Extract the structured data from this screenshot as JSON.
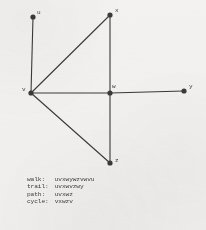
{
  "figure": {
    "type": "undirected-graph-diagram",
    "vertices": [
      {
        "id": "u",
        "label": "u",
        "x": 33,
        "y": 17,
        "label_dx": 4,
        "label_dy": -7
      },
      {
        "id": "x",
        "label": "x",
        "x": 110,
        "y": 15,
        "label_dx": 5,
        "label_dy": -7
      },
      {
        "id": "v",
        "label": "v",
        "x": 31,
        "y": 93,
        "label_dx": -9,
        "label_dy": -6
      },
      {
        "id": "w",
        "label": "w",
        "x": 110,
        "y": 93,
        "label_dx": 2,
        "label_dy": -9
      },
      {
        "id": "y",
        "label": "y",
        "x": 184,
        "y": 91,
        "label_dx": 5,
        "label_dy": -7
      },
      {
        "id": "z",
        "label": "z",
        "x": 110,
        "y": 163,
        "label_dx": 5,
        "label_dy": -5
      }
    ],
    "edges": [
      {
        "from": "u",
        "to": "v"
      },
      {
        "from": "v",
        "to": "x"
      },
      {
        "from": "x",
        "to": "w"
      },
      {
        "from": "v",
        "to": "w"
      },
      {
        "from": "w",
        "to": "y"
      },
      {
        "from": "v",
        "to": "z"
      },
      {
        "from": "w",
        "to": "z"
      }
    ],
    "ink_color": "#3a3a38",
    "vertex_radius": 2.6,
    "edge_width": 1.1
  },
  "legend": {
    "rows": [
      {
        "key": "walk:",
        "value": "uvxwywzvwvu"
      },
      {
        "key": "trail:",
        "value": "uvxwvzwy"
      },
      {
        "key": "path:",
        "value": "uvxwz"
      },
      {
        "key": "cycle:",
        "value": "vxwzv"
      }
    ]
  }
}
